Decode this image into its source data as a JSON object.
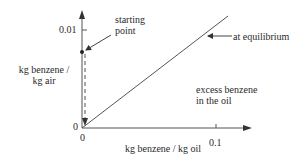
{
  "diagram": {
    "type": "equilibrium-operating-plot",
    "y_axis": {
      "label_line1": "kg benzene /",
      "label_line2": "kg air",
      "ticks": [
        {
          "value": "0",
          "label": "0"
        },
        {
          "value": "0.01",
          "label": "0.01"
        }
      ]
    },
    "x_axis": {
      "label": "kg benzene / kg oil",
      "ticks": [
        {
          "value": "0",
          "label": "0"
        },
        {
          "value": "0.1",
          "label": "0.1"
        }
      ]
    },
    "annotations": {
      "starting_point_line1": "starting",
      "starting_point_line2": "point",
      "equilibrium": "at equilibrium",
      "region_line1": "excess benzene",
      "region_line2": "in the oil"
    },
    "colors": {
      "line": "#555555",
      "text": "#2a2a2a",
      "background": "#ffffff"
    }
  }
}
